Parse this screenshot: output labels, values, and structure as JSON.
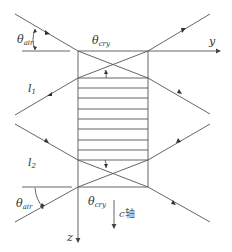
{
  "diagram": {
    "title": "",
    "colors": {
      "line": "#444444",
      "text": "#333333"
    },
    "axes": {
      "y_label": "y",
      "z_label": "z",
      "c_axis_symbol": "c",
      "c_axis_suffix": "轴"
    },
    "beams": {
      "l1": {
        "symbol": "l",
        "sub": "1"
      },
      "l2": {
        "symbol": "l",
        "sub": "2"
      }
    },
    "angles": {
      "top_air": {
        "symbol": "θ",
        "sub": "air"
      },
      "top_cry": {
        "symbol": "θ",
        "sub": "cry"
      },
      "bottom_air": {
        "symbol": "θ",
        "sub": "air"
      },
      "bottom_cry": {
        "symbol": "θ",
        "sub": "cry"
      }
    },
    "crystal": {
      "stripe_count": 9
    }
  }
}
